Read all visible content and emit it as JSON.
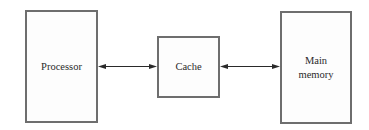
{
  "diagram": {
    "nodes": [
      {
        "id": "processor",
        "lines": [
          "Processor"
        ]
      },
      {
        "id": "cache",
        "lines": [
          "Cache"
        ]
      },
      {
        "id": "main_memory",
        "lines": [
          "Main",
          "memory"
        ]
      }
    ],
    "edges": [
      {
        "from": "processor",
        "to": "cache",
        "direction": "bidirectional"
      },
      {
        "from": "cache",
        "to": "main_memory",
        "direction": "bidirectional"
      }
    ],
    "colors": {
      "border": "#6e6e6e",
      "arrow": "#2a2a2a",
      "text": "#2a2a2a"
    }
  }
}
